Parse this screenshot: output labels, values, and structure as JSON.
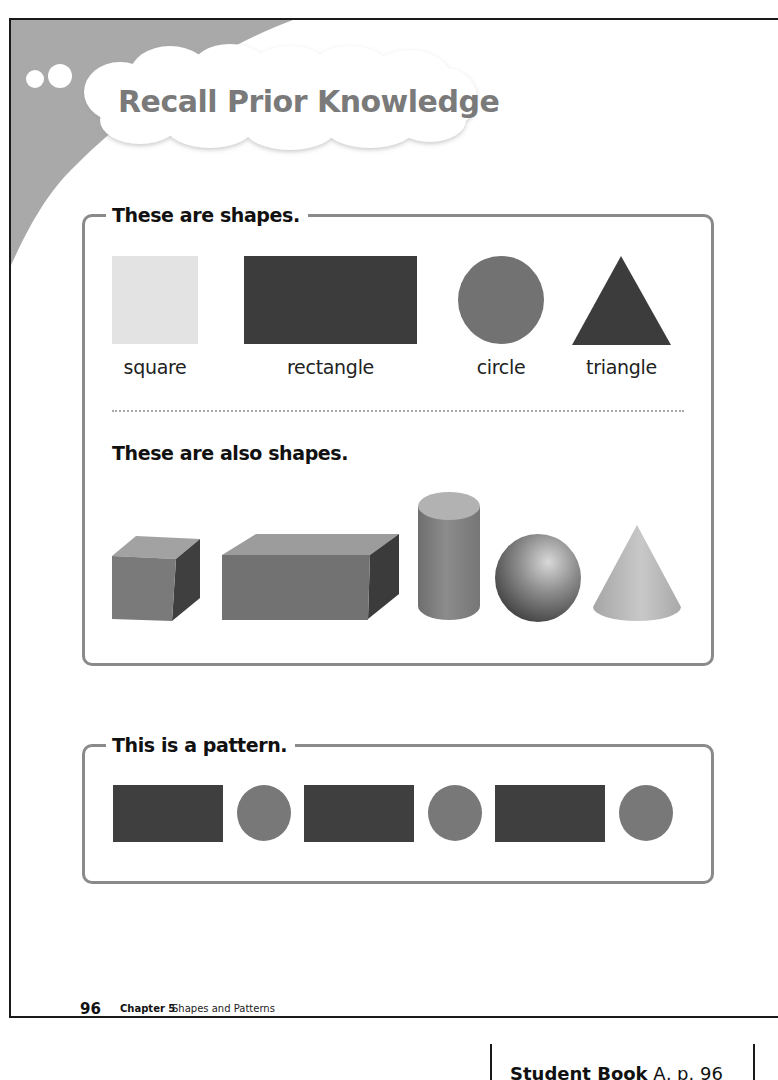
{
  "header": {
    "title": "Recall Prior Knowledge"
  },
  "section_2d": {
    "label": "These are shapes.",
    "shapes": [
      {
        "name": "square",
        "label": "square",
        "color": "#e3e3e3"
      },
      {
        "name": "rectangle",
        "label": "rectangle",
        "color": "#3c3c3c"
      },
      {
        "name": "circle",
        "label": "circle",
        "color": "#727272"
      },
      {
        "name": "triangle",
        "label": "triangle",
        "color": "#3c3c3c"
      }
    ]
  },
  "section_3d": {
    "label": "These are also shapes.",
    "solids": [
      {
        "name": "cube"
      },
      {
        "name": "rectangular-prism"
      },
      {
        "name": "cylinder"
      },
      {
        "name": "sphere"
      },
      {
        "name": "cone"
      }
    ]
  },
  "section_pattern": {
    "label": "This is a pattern.",
    "sequence": [
      "rectangle",
      "circle",
      "rectangle",
      "circle",
      "rectangle",
      "circle"
    ],
    "rect_color": "#3f3f3f",
    "circle_color": "#787878"
  },
  "footer": {
    "page_number": "96",
    "chapter": "Chapter 5",
    "chapter_title": "Shapes and Patterns"
  },
  "reference": {
    "book": "Student Book",
    "rest": " A, p. 96"
  },
  "colors": {
    "swoosh": "#a8a8a8",
    "box_border": "#8a8a8a",
    "title_text": "#7a7a7a"
  }
}
